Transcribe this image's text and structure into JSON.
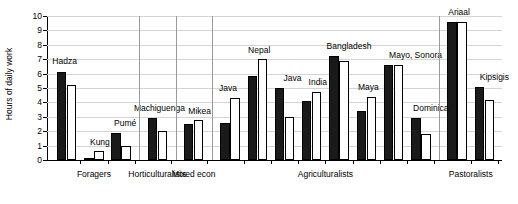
{
  "chart_data": {
    "type": "bar",
    "title": "",
    "xlabel": "",
    "ylabel": "Hours of daily work",
    "ylim": [
      0,
      10
    ],
    "yticks": [
      0,
      1,
      2,
      3,
      4,
      5,
      6,
      7,
      8,
      9,
      10
    ],
    "grid": true,
    "legend": "none",
    "series": [
      {
        "name": "dark",
        "color": "#1a1a1a"
      },
      {
        "name": "light",
        "color": "#ffffff"
      }
    ],
    "groups": [
      {
        "label": "Foragers",
        "categories": [
          "Hadza",
          "Kung",
          "Pumé"
        ],
        "dark": [
          6.1,
          0.15,
          1.9
        ],
        "light": [
          5.2,
          0.6,
          1.0
        ]
      },
      {
        "label": "Horticulturalists",
        "categories": [
          "Machiguenga"
        ],
        "dark": [
          2.9
        ],
        "light": [
          2.0
        ]
      },
      {
        "label": "Mixed econ",
        "categories": [
          "Mikea"
        ],
        "dark": [
          2.5
        ],
        "light": [
          2.8
        ]
      },
      {
        "label": "Agriculturalists",
        "categories": [
          "Java",
          "Nepal",
          "Java",
          "India",
          "Bangladesh",
          "Maya",
          "Mayo, Sonora",
          "Dominica"
        ],
        "dark": [
          2.6,
          5.8,
          5.0,
          4.1,
          7.2,
          3.4,
          6.6,
          2.9
        ],
        "light": [
          4.3,
          7.0,
          3.0,
          4.7,
          6.9,
          4.4,
          6.6,
          1.8
        ]
      },
      {
        "label": "Pastoralists",
        "categories": [
          "Ariaal",
          "Kipsigis"
        ],
        "dark": [
          9.6,
          5.1
        ],
        "light": [
          9.6,
          4.2
        ]
      }
    ],
    "point_labels": [
      "Hadza",
      "Kung",
      "Pumé",
      "Machiguenga",
      "Mikea",
      "Java",
      "Nepal",
      "Java",
      "India",
      "Bangladesh",
      "Maya",
      "Mayo, Sonora",
      "Dominica",
      "Ariaal",
      "Kipsigis"
    ]
  }
}
